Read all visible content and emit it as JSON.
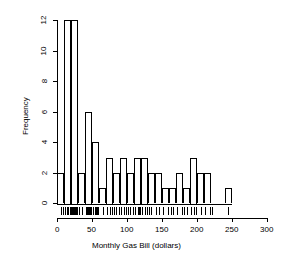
{
  "chart_data": {
    "type": "bar",
    "title": "",
    "subtitle": "",
    "xlabel": "Monthly Gas Bill (dollars)",
    "ylabel": "Frequency",
    "xlim": [
      0,
      300
    ],
    "ylim": [
      0,
      12
    ],
    "grid": false,
    "legend": null,
    "bin_width": 10,
    "bin_starts": [
      0,
      10,
      20,
      30,
      40,
      50,
      60,
      70,
      80,
      90,
      100,
      110,
      120,
      130,
      140,
      150,
      160,
      170,
      180,
      190,
      200,
      210,
      220,
      230,
      240
    ],
    "bin_ends": [
      10,
      20,
      30,
      40,
      50,
      60,
      70,
      80,
      90,
      100,
      110,
      120,
      130,
      140,
      150,
      160,
      170,
      180,
      190,
      200,
      210,
      220,
      230,
      240,
      250
    ],
    "categories": [
      "0-10",
      "10-20",
      "20-30",
      "30-40",
      "40-50",
      "50-60",
      "60-70",
      "70-80",
      "80-90",
      "90-100",
      "100-110",
      "110-120",
      "120-130",
      "130-140",
      "140-150",
      "150-160",
      "160-170",
      "170-180",
      "180-190",
      "190-200",
      "200-210",
      "210-220",
      "220-230",
      "230-240",
      "240-250"
    ],
    "values": [
      2,
      12,
      12,
      2,
      6,
      4,
      1,
      3,
      2,
      3,
      2,
      3,
      3,
      2,
      2,
      1,
      1,
      2,
      1,
      3,
      2,
      2,
      0,
      0,
      1
    ],
    "xticks": [
      0,
      50,
      100,
      150,
      200,
      250,
      300
    ],
    "xtick_labels": [
      "0",
      "50",
      "100",
      "150",
      "200",
      "250",
      "300"
    ],
    "yticks": [
      0,
      2,
      4,
      6,
      8,
      10,
      12
    ],
    "ytick_labels": [
      "0",
      "2",
      "4",
      "6",
      "8",
      "10",
      "12"
    ],
    "rug": {
      "present": true,
      "values": [
        5,
        8,
        12,
        14,
        15,
        16,
        18,
        19,
        20,
        21,
        22,
        23,
        24,
        25,
        26,
        27,
        28,
        29,
        32,
        36,
        41,
        43,
        44,
        45,
        46,
        47,
        48,
        49,
        52,
        54,
        56,
        57,
        58,
        65,
        72,
        75,
        78,
        82,
        84,
        88,
        92,
        95,
        98,
        101,
        104,
        108,
        112,
        115,
        117,
        119,
        122,
        125,
        128,
        131,
        134,
        142,
        146,
        152,
        158,
        163,
        166,
        172,
        178,
        181,
        186,
        192,
        195,
        198,
        205,
        212,
        218,
        222,
        244
      ]
    }
  }
}
